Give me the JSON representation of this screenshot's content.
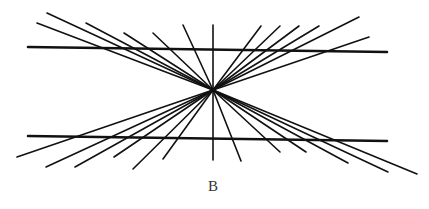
{
  "figure": {
    "label": "B",
    "stroke_color": "#111111",
    "background": "#ffffff",
    "center": [
      213,
      90
    ],
    "horizontal_lines": [
      {
        "x1": 28,
        "y1": 47,
        "x2": 387,
        "y2": 52
      },
      {
        "x1": 28,
        "y1": 136,
        "x2": 387,
        "y2": 141
      }
    ],
    "vertical_line": {
      "x1": 213,
      "y1": 25,
      "x2": 213,
      "y2": 160
    },
    "ray_endpoints": [
      [
        37,
        23
      ],
      [
        47,
        13
      ],
      [
        86,
        23
      ],
      [
        124,
        33
      ],
      [
        153,
        33
      ],
      [
        183,
        25
      ],
      [
        261,
        26
      ],
      [
        280,
        26
      ],
      [
        299,
        26
      ],
      [
        319,
        26
      ],
      [
        359,
        17
      ],
      [
        369,
        37
      ],
      [
        17,
        157
      ],
      [
        46,
        167
      ],
      [
        75,
        167
      ],
      [
        114,
        157
      ],
      [
        133,
        169
      ],
      [
        163,
        159
      ],
      [
        241,
        161
      ],
      [
        280,
        152
      ],
      [
        306,
        152
      ],
      [
        348,
        163
      ],
      [
        388,
        172
      ],
      [
        417,
        174
      ]
    ]
  }
}
